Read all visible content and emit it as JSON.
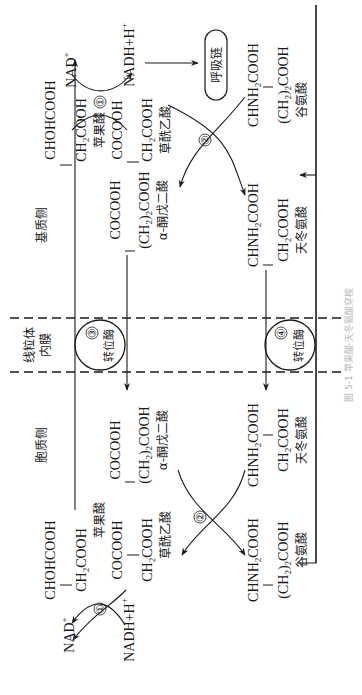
{
  "figure": {
    "caption": "图 5-1  苹果酸-天冬氨酸穿梭",
    "orientation": "rotated 90° counter-clockwise (text reads bottom-to-top)"
  },
  "regions": {
    "matrix_side": "基质侧",
    "cytosol_side": "胞质侧",
    "membrane": [
      "线粒体",
      "内膜"
    ]
  },
  "cofactors": {
    "nad_plus": "NAD",
    "nad_plus_sup": "+",
    "nadh": "NADH+H",
    "nadh_sup": "+",
    "respiratory_chain": "呼吸链"
  },
  "enzymes": {
    "e1": "①",
    "e2": "②",
    "e3": "③",
    "e4": "④",
    "transporter_label": "转位酶"
  },
  "matrix": {
    "malate": {
      "line1": "CHOHCOOH",
      "line2a": "CH",
      "line2sub": "2",
      "line2b": "COOH",
      "name": "苹果酸"
    },
    "oxaloacetate": {
      "line1": "COCOOH",
      "line2a": "CH",
      "line2sub": "2",
      "line2b": "COOH",
      "name": "草酰乙酸"
    },
    "glutamate": {
      "line1a": "CHNH",
      "line1sub": "2",
      "line1b": "COOH",
      "line2a": "(CH",
      "line2sub": "2",
      "line2b": ")",
      "line2sub2": "2",
      "line2c": "COOH",
      "name": "谷氨酸"
    },
    "alpha_kg": {
      "line1": "COCOOH",
      "line2a": "(CH",
      "line2sub": "2",
      "line2b": ")",
      "line2sub2": "2",
      "line2c": "COOH",
      "name": "α-酮戊二酸"
    },
    "aspartate": {
      "line1a": "CHNH",
      "line1sub": "2",
      "line1b": "COOH",
      "line2a": "CH",
      "line2sub": "2",
      "line2b": "COOH",
      "name": "天冬氨酸"
    }
  },
  "cytosol": {
    "malate": {
      "line1": "CHOHCOOH",
      "line2a": "CH",
      "line2sub": "2",
      "line2b": "COOH",
      "name": "苹果酸"
    },
    "oxaloacetate": {
      "line1": "COCOOH",
      "line2a": "CH",
      "line2sub": "2",
      "line2b": "COOH",
      "name": "草酰乙酸"
    },
    "glutamate": {
      "line1a": "CHNH",
      "line1sub": "2",
      "line1b": "COOH",
      "line2a": "(CH",
      "line2sub": "2",
      "line2b": ")",
      "line2sub2": "2",
      "line2c": "COOH",
      "name": "谷氨酸"
    },
    "alpha_kg": {
      "line1": "COCOOH",
      "line2a": "(CH",
      "line2sub": "2",
      "line2b": ")",
      "line2sub2": "2",
      "line2c": "COOH",
      "name": "α-酮戊二酸"
    },
    "aspartate": {
      "line1a": "CHNH",
      "line1sub": "2",
      "line1b": "COOH",
      "line2a": "CH",
      "line2sub": "2",
      "line2b": "COOH",
      "name": "天冬氨酸"
    }
  },
  "colors": {
    "ink": "#1a1a1a",
    "background": "#ffffff",
    "caption": "#b8b8b8"
  }
}
